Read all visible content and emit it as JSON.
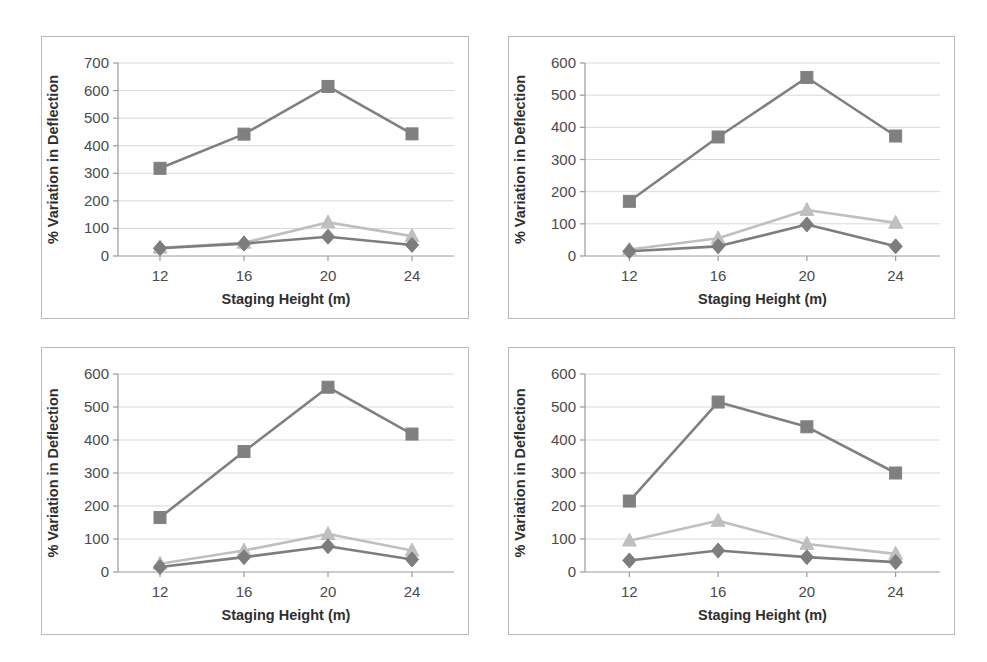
{
  "figure": {
    "panel_count": 4,
    "border_color": "#b9b9b9",
    "background": "#ffffff"
  },
  "series_style": {
    "diamond_color": "#7d7d7d",
    "triangle_color": "#bfbfbf",
    "square_color": "#808080",
    "gridline_color": "#d9d9d9",
    "axis_color": "#9a9a9a"
  },
  "chart_data": [
    {
      "type": "line",
      "panel": "top-left",
      "title": "",
      "xlabel": "Staging Height (m)",
      "ylabel": "% Variation in Deflection",
      "categories": [
        "12",
        "16",
        "20",
        "24"
      ],
      "x": [
        12,
        16,
        20,
        24
      ],
      "ylim": [
        0,
        700
      ],
      "yticks": [
        0,
        100,
        200,
        300,
        400,
        500,
        600,
        700
      ],
      "grid": true,
      "legend": "none",
      "series": [
        {
          "name": "diamond",
          "marker": "diamond",
          "color": "#7d7d7d",
          "values": [
            28,
            45,
            70,
            40
          ]
        },
        {
          "name": "triangle",
          "marker": "triangle",
          "color": "#bfbfbf",
          "values": [
            30,
            48,
            122,
            72
          ]
        },
        {
          "name": "square",
          "marker": "square",
          "color": "#808080",
          "values": [
            318,
            442,
            615,
            443
          ]
        }
      ]
    },
    {
      "type": "line",
      "panel": "top-right",
      "title": "",
      "xlabel": "Staging Height (m)",
      "ylabel": "% Variation in Deflection",
      "categories": [
        "12",
        "16",
        "20",
        "24"
      ],
      "x": [
        12,
        16,
        20,
        24
      ],
      "ylim": [
        0,
        600
      ],
      "yticks": [
        0,
        100,
        200,
        300,
        400,
        500,
        600
      ],
      "grid": true,
      "legend": "none",
      "series": [
        {
          "name": "diamond",
          "marker": "diamond",
          "color": "#7d7d7d",
          "values": [
            15,
            30,
            98,
            30
          ]
        },
        {
          "name": "triangle",
          "marker": "triangle",
          "color": "#bfbfbf",
          "values": [
            20,
            55,
            143,
            103
          ]
        },
        {
          "name": "square",
          "marker": "square",
          "color": "#808080",
          "values": [
            170,
            370,
            555,
            373
          ]
        }
      ]
    },
    {
      "type": "line",
      "panel": "bottom-left",
      "title": "",
      "xlabel": "Staging Height (m)",
      "ylabel": "% Variation in Deflection",
      "categories": [
        "12",
        "16",
        "20",
        "24"
      ],
      "x": [
        12,
        16,
        20,
        24
      ],
      "ylim": [
        0,
        600
      ],
      "yticks": [
        0,
        100,
        200,
        300,
        400,
        500,
        600
      ],
      "grid": true,
      "legend": "none",
      "series": [
        {
          "name": "diamond",
          "marker": "diamond",
          "color": "#7d7d7d",
          "values": [
            15,
            45,
            78,
            38
          ]
        },
        {
          "name": "triangle",
          "marker": "triangle",
          "color": "#bfbfbf",
          "values": [
            25,
            65,
            115,
            65
          ]
        },
        {
          "name": "square",
          "marker": "square",
          "color": "#808080",
          "values": [
            165,
            365,
            560,
            418
          ]
        }
      ]
    },
    {
      "type": "line",
      "panel": "bottom-right",
      "title": "",
      "xlabel": "Staging Height (m)",
      "ylabel": "% Variation in Deflection",
      "categories": [
        "12",
        "16",
        "20",
        "24"
      ],
      "x": [
        12,
        16,
        20,
        24
      ],
      "ylim": [
        0,
        600
      ],
      "yticks": [
        0,
        100,
        200,
        300,
        400,
        500,
        600
      ],
      "grid": true,
      "legend": "none",
      "series": [
        {
          "name": "diamond",
          "marker": "diamond",
          "color": "#7d7d7d",
          "values": [
            35,
            65,
            45,
            30
          ]
        },
        {
          "name": "triangle",
          "marker": "triangle",
          "color": "#bfbfbf",
          "values": [
            95,
            155,
            85,
            55
          ]
        },
        {
          "name": "square",
          "marker": "square",
          "color": "#808080",
          "values": [
            215,
            515,
            440,
            300
          ]
        }
      ]
    }
  ]
}
